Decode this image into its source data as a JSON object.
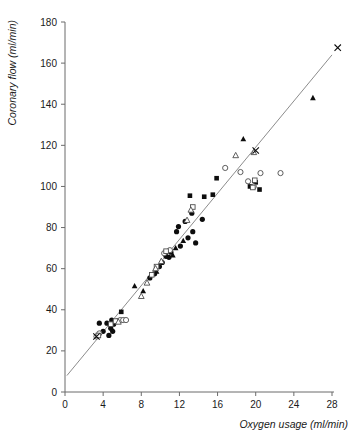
{
  "chart_data": {
    "type": "scatter",
    "title": "",
    "xlabel": "Oxygen usage (ml/min)",
    "ylabel": "Coronary flow (ml/min)",
    "xlim": [
      0,
      28
    ],
    "ylim": [
      0,
      180
    ],
    "xticks": [
      0,
      4,
      8,
      12,
      16,
      20,
      24,
      28
    ],
    "yticks": [
      0,
      20,
      40,
      60,
      80,
      100,
      120,
      140,
      160,
      180
    ],
    "grid": false,
    "legend": "none",
    "fit_line": {
      "label": "regression line",
      "x": [
        0.2,
        28.0
      ],
      "y": [
        8.0,
        164.0
      ],
      "slope": 5.61,
      "intercept": 6.88,
      "color": "#8c8c8c"
    },
    "series": [
      {
        "name": "filled-circle",
        "marker": "filled circle",
        "color": "#0d0d0d",
        "points": [
          [
            3.6,
            33.5
          ],
          [
            4.0,
            29.5
          ],
          [
            4.4,
            33.5
          ],
          [
            4.6,
            27.5
          ],
          [
            4.8,
            31.0
          ],
          [
            5.0,
            29.5
          ],
          [
            5.1,
            33.0
          ],
          [
            4.9,
            35.0
          ],
          [
            8.9,
            55.5
          ],
          [
            9.4,
            57.5
          ],
          [
            10.2,
            63.0
          ],
          [
            10.6,
            66.0
          ],
          [
            11.1,
            68.0
          ],
          [
            11.7,
            78.0
          ],
          [
            11.9,
            80.5
          ],
          [
            12.6,
            83.0
          ],
          [
            12.9,
            75.0
          ],
          [
            13.3,
            87.0
          ],
          [
            13.4,
            78.0
          ],
          [
            13.7,
            72.5
          ],
          [
            14.4,
            84.0
          ],
          [
            12.1,
            71.0
          ],
          [
            10.9,
            65.5
          ],
          [
            9.9,
            61.0
          ]
        ]
      },
      {
        "name": "filled-square",
        "marker": "filled square",
        "color": "#0d0d0d",
        "points": [
          [
            5.9,
            39.0
          ],
          [
            13.1,
            95.5
          ],
          [
            14.6,
            95.0
          ],
          [
            15.5,
            96.0
          ],
          [
            15.9,
            104.0
          ],
          [
            20.0,
            102.0
          ],
          [
            20.4,
            98.5
          ],
          [
            19.4,
            100.0
          ]
        ]
      },
      {
        "name": "filled-triangle",
        "marker": "filled triangle",
        "color": "#0d0d0d",
        "points": [
          [
            7.3,
            51.5
          ],
          [
            9.6,
            58.5
          ],
          [
            11.3,
            66.5
          ],
          [
            11.6,
            70.0
          ],
          [
            12.4,
            73.5
          ],
          [
            18.7,
            123.0
          ],
          [
            26.0,
            143.0
          ],
          [
            8.2,
            49.0
          ]
        ]
      },
      {
        "name": "open-circle",
        "marker": "open circle",
        "color": "#ffffff",
        "points": [
          [
            3.3,
            27.0
          ],
          [
            3.6,
            28.5
          ],
          [
            5.5,
            34.5
          ],
          [
            5.8,
            35.0
          ],
          [
            6.1,
            35.0
          ],
          [
            6.4,
            35.0
          ],
          [
            10.4,
            67.5
          ],
          [
            11.0,
            69.0
          ],
          [
            18.4,
            107.0
          ],
          [
            19.2,
            102.5
          ],
          [
            20.5,
            106.5
          ],
          [
            22.6,
            106.5
          ],
          [
            16.8,
            109.0
          ],
          [
            19.8,
            100.0
          ]
        ]
      },
      {
        "name": "open-square",
        "marker": "open square",
        "color": "#ffffff",
        "points": [
          [
            3.5,
            27.5
          ],
          [
            4.8,
            33.0
          ],
          [
            5.3,
            34.5
          ],
          [
            9.6,
            61.0
          ],
          [
            10.6,
            68.5
          ],
          [
            13.4,
            90.0
          ],
          [
            19.7,
            99.5
          ],
          [
            19.9,
            103.0
          ],
          [
            9.1,
            57.0
          ]
        ]
      },
      {
        "name": "open-triangle",
        "marker": "open triangle",
        "color": "#ffffff",
        "points": [
          [
            5.6,
            34.0
          ],
          [
            8.6,
            53.0
          ],
          [
            9.5,
            60.0
          ],
          [
            10.1,
            63.5
          ],
          [
            12.8,
            83.5
          ],
          [
            13.2,
            88.5
          ],
          [
            8.0,
            46.5
          ],
          [
            19.8,
            116.5
          ],
          [
            17.9,
            115.0
          ]
        ]
      },
      {
        "name": "cross",
        "marker": "x",
        "color": "#0d0d0d",
        "points": [
          [
            3.3,
            27.0
          ],
          [
            20.0,
            117.5
          ],
          [
            28.6,
            167.5
          ]
        ]
      }
    ]
  }
}
